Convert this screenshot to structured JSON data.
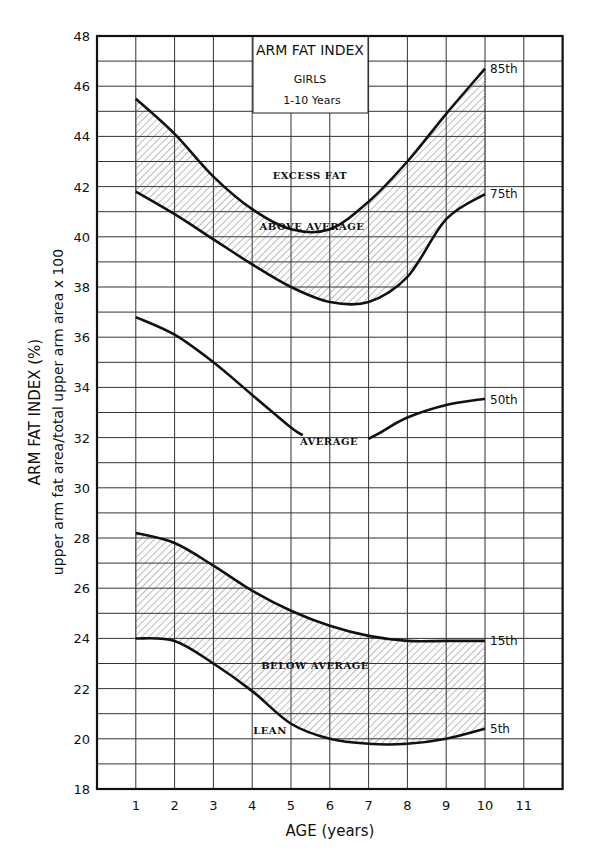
{
  "chart_data": {
    "type": "line",
    "title": "ARM FAT INDEX",
    "subtitle": "GIRLS",
    "subtitle2": "1-10 Years",
    "xlabel": "AGE (years)",
    "ylabel": "ARM FAT INDEX (%)",
    "ylabel_sub": "upper arm fat area/total upper arm area x 100",
    "xlim": [
      0,
      12
    ],
    "ylim": [
      18,
      48
    ],
    "x_ticks": [
      "1",
      "2",
      "3",
      "4",
      "5",
      "6",
      "7",
      "8",
      "9",
      "10",
      "11"
    ],
    "y_ticks": [
      "18",
      "20",
      "22",
      "24",
      "26",
      "28",
      "30",
      "32",
      "34",
      "36",
      "38",
      "40",
      "42",
      "44",
      "46",
      "48"
    ],
    "grid": true,
    "x": [
      1,
      2,
      3,
      4,
      5,
      6,
      7,
      8,
      9,
      10
    ],
    "series": [
      {
        "name": "85th",
        "values": [
          45.5,
          44.1,
          42.4,
          41.1,
          40.3,
          40.3,
          41.4,
          43.0,
          44.9,
          46.7
        ]
      },
      {
        "name": "75th",
        "values": [
          41.8,
          40.9,
          39.9,
          38.9,
          38.0,
          37.4,
          37.4,
          38.4,
          40.7,
          41.7
        ]
      },
      {
        "name": "50th",
        "values": [
          36.8,
          36.1,
          35.0,
          33.7,
          32.2,
          null,
          31.9,
          32.8,
          33.3,
          33.5
        ]
      },
      {
        "name": "15th",
        "values": [
          28.2,
          27.8,
          26.9,
          25.9,
          25.1,
          24.5,
          24.1,
          23.9,
          23.9,
          23.9
        ]
      },
      {
        "name": "5th",
        "values": [
          24.0,
          23.9,
          23.0,
          21.9,
          20.6,
          20.0,
          19.8,
          19.8,
          20.0,
          20.4
        ]
      }
    ],
    "region_labels": [
      "EXCESS FAT",
      "ABOVE AVERAGE",
      "AVERAGE",
      "BELOW AVERAGE",
      "LEAN"
    ],
    "shaded_bands": [
      [
        "75th",
        "85th"
      ],
      [
        "5th",
        "15th"
      ]
    ],
    "legend_position": "inline labels at right end of curves"
  },
  "labels": {
    "title": "ARM FAT INDEX",
    "subtitle": "GIRLS",
    "range": "1-10 Years",
    "xlabel": "AGE (years)",
    "ylabel": "ARM FAT INDEX (%)",
    "ylabel_sub": "upper arm fat area/total upper arm area x 100",
    "excess": "EXCESS FAT",
    "above": "ABOVE AVERAGE",
    "average": "AVERAGE",
    "below": "BELOW AVERAGE",
    "lean": "LEAN",
    "p85": "85th",
    "p75": "75th",
    "p50": "50th",
    "p15": "15th",
    "p5": "5th"
  }
}
